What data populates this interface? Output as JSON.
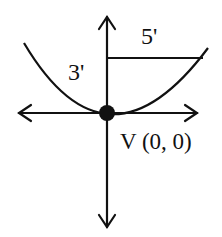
{
  "diagram": {
    "type": "parabola-on-axes",
    "colors": {
      "stroke": "#111111",
      "background": "#ffffff"
    },
    "labels": {
      "width_dimension": "5'",
      "height_dimension": "3'",
      "vertex": "V (0, 0)"
    },
    "vertex": {
      "x": 0,
      "y": 0
    },
    "dimensions": {
      "half_width_ft": 5,
      "depth_ft": 3
    }
  }
}
